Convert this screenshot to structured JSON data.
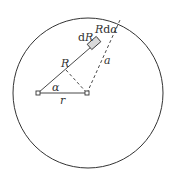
{
  "diagram": {
    "type": "geometry",
    "labels": {
      "dR": "dR",
      "d_prefix": "d",
      "R_var": "R",
      "Rdalpha_R": "R",
      "Rdalpha_d": "d",
      "Rdalpha_alpha": "α",
      "R": "R",
      "a": "a",
      "alpha": "α",
      "r": "r"
    },
    "colors": {
      "stroke": "#333333",
      "element_fill": "#d9d9d9",
      "background": "#ffffff"
    }
  }
}
